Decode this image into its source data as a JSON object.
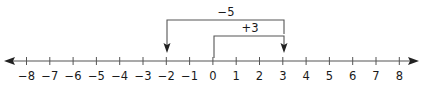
{
  "number_line": {
    "min": -8,
    "max": 8,
    "tick_labels": [
      "−8",
      "−7",
      "−6",
      "−5",
      "−4",
      "−3",
      "−2",
      "−1",
      "0",
      "1",
      "2",
      "3",
      "4",
      "5",
      "6",
      "7",
      "8"
    ],
    "line_color": "#444444"
  },
  "moves": [
    {
      "label": "+3",
      "from": 0,
      "to": 3
    },
    {
      "label": "−5",
      "from": 3,
      "to": -2
    }
  ]
}
